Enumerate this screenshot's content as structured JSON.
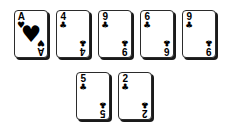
{
  "scene": {
    "title": "Playing card hand",
    "background_color": "#ffffff",
    "card_face_color": "#ffffff",
    "card_border_color": "#2b2b2b",
    "card_shadow_color": "#1a1a1a",
    "pip_color": "#000000"
  },
  "suit_glyphs": {
    "hearts": "♥",
    "clubs": "♣",
    "spades": "♠",
    "diamonds": "♦"
  },
  "rows": [
    {
      "name": "top-row",
      "cards": [
        {
          "rank": "A",
          "suit": "hearts",
          "glyph": "♥",
          "label": "Ace of Hearts",
          "big_pip": true
        },
        {
          "rank": "4",
          "suit": "clubs",
          "glyph": "♣",
          "label": "Four of Clubs",
          "big_pip": false
        },
        {
          "rank": "9",
          "suit": "clubs",
          "glyph": "♣",
          "label": "Nine of Clubs",
          "big_pip": false
        },
        {
          "rank": "6",
          "suit": "clubs",
          "glyph": "♣",
          "label": "Six of Clubs",
          "big_pip": false
        },
        {
          "rank": "9",
          "suit": "clubs",
          "glyph": "♣",
          "label": "Nine of Clubs",
          "big_pip": false
        }
      ]
    },
    {
      "name": "bottom-row",
      "cards": [
        {
          "rank": "5",
          "suit": "clubs",
          "glyph": "♣",
          "label": "Five of Clubs",
          "big_pip": false
        },
        {
          "rank": "2",
          "suit": "clubs",
          "glyph": "♣",
          "label": "Two of Clubs",
          "big_pip": false
        }
      ]
    }
  ]
}
